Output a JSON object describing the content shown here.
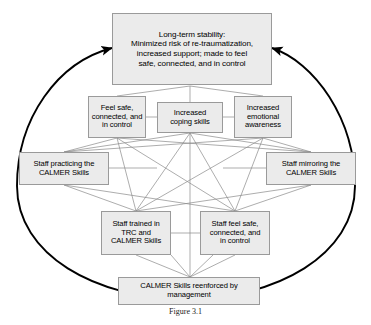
{
  "figure": {
    "caption": "Figure 3.1",
    "colors": {
      "node_fill": "#ebebeb",
      "node_border": "#9a9a9a",
      "connector": "#8a8a8a",
      "cycle_arrow": "#000000",
      "text": "#000000"
    }
  },
  "nodes": {
    "top_outcome": {
      "label": "Long-term stability:\nMinimized risk of re-traumatization,\nincreased support; made to feel\nsafe, connected, and in control"
    },
    "client_feel_safe": {
      "label": "Feel safe,\nconnected, and\nin control"
    },
    "coping_skills": {
      "label": "Increased\ncoping skills"
    },
    "emotional_awareness": {
      "label": "Increased\nemotional\nawareness"
    },
    "staff_practicing": {
      "label": "Staff practicing the\nCALMER Skills"
    },
    "staff_mirroring": {
      "label": "Staff mirroring the\nCALMER Skills"
    },
    "staff_trained": {
      "label": "Staff trained in\nTRC and\nCALMER Skills"
    },
    "staff_feel_safe": {
      "label": "Staff feel safe,\nconnected, and\nin control"
    },
    "management_reenforced": {
      "label": "CALMER Skills reenforced by\nmanagement"
    }
  },
  "icons": {
    "cycle_arrow_left": "cycle-arrow-left-icon",
    "cycle_arrow_right": "cycle-arrow-right-icon"
  }
}
